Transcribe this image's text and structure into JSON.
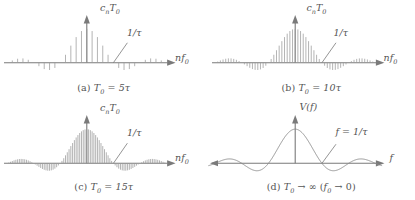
{
  "figure": {
    "axis_color": "#7a7a7a",
    "line_color": "#9a9a9a",
    "curve_color": "#8a8a8a",
    "text_color": "#545454"
  },
  "panels": [
    {
      "id": "a",
      "caption_tag": "(a)",
      "caption_body": "T0 = 5τ",
      "ylabel": "cnT0",
      "xlabel": "nf0",
      "annotation": "1/τ",
      "type": "line-spectrum",
      "duty_ratio": 5,
      "lines_per_null": 5
    },
    {
      "id": "b",
      "caption_tag": "(b)",
      "caption_body": "T0 = 10τ",
      "ylabel": "cnT0",
      "xlabel": "nf0",
      "annotation": "1/τ",
      "type": "line-spectrum",
      "duty_ratio": 10,
      "lines_per_null": 10
    },
    {
      "id": "c",
      "caption_tag": "(c)",
      "caption_body": "T0 = 15τ",
      "ylabel": "cnT0",
      "xlabel": "nf0",
      "annotation": "1/τ",
      "type": "line-spectrum",
      "duty_ratio": 15,
      "lines_per_null": 15
    },
    {
      "id": "d",
      "caption_tag": "(d)",
      "caption_body": "T0 → ∞ (f0 → 0)",
      "ylabel": "V(f)",
      "xlabel": "f",
      "annotation": "f = 1/τ",
      "type": "continuous-sinc",
      "duty_ratio": 0,
      "lines_per_null": 0
    }
  ],
  "chart_data": {
    "type": "line",
    "envelope_function": "sinc(pi * f * tau)",
    "xlabel_panels_abc": "nf0",
    "xlabel_panel_d": "f",
    "ylabel_panels_abc": "cnT0",
    "ylabel_panel_d": "V(f)",
    "x_range_in_nulls": [
      -3,
      3
    ],
    "first_null_label": "1/τ",
    "y_peak_normalized": 1.0,
    "sidelobe_peaks_normalized": [
      -0.2172,
      0.1284,
      -0.0913
    ],
    "null_positions_in_nulls": [
      -3,
      -2,
      -1,
      1,
      2,
      3
    ],
    "series": [
      {
        "name": "(a) T0 = 5τ",
        "harmonic_spacing_per_null": 0.2,
        "discrete": true
      },
      {
        "name": "(b) T0 = 10τ",
        "harmonic_spacing_per_null": 0.1,
        "discrete": true
      },
      {
        "name": "(c) T0 = 15τ",
        "harmonic_spacing_per_null": 0.0667,
        "discrete": true
      },
      {
        "name": "(d) T0 → ∞",
        "harmonic_spacing_per_null": 0,
        "discrete": false
      }
    ],
    "grid": false,
    "legend": "none"
  }
}
